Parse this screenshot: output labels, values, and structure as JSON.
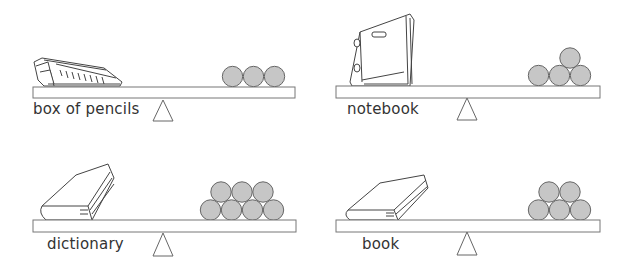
{
  "colors": {
    "ball_fill": "#c6c6c6",
    "ball_stroke": "#666666",
    "plank_stroke": "#777777",
    "fulcrum_stroke": "#666666",
    "label_text": "#333333"
  },
  "panels": [
    {
      "id": "box-of-pencils",
      "label": "box of pencils",
      "object_icon": "pencil-box-icon",
      "ball_count": 3,
      "arrangement": "row of 3"
    },
    {
      "id": "notebook",
      "label": "notebook",
      "object_icon": "notebook-icon",
      "ball_count": 4,
      "arrangement": "3 bottom, 1 top"
    },
    {
      "id": "dictionary",
      "label": "dictionary",
      "object_icon": "book-icon",
      "ball_count": 7,
      "arrangement": "4 bottom, 3 top"
    },
    {
      "id": "book",
      "label": "book",
      "object_icon": "book-icon",
      "ball_count": 5,
      "arrangement": "3 bottom, 2 top"
    }
  ]
}
